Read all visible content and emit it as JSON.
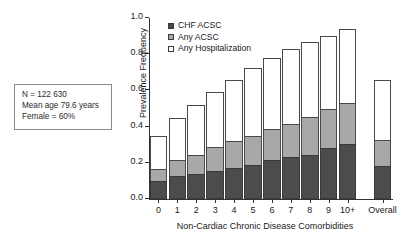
{
  "annotation": {
    "lines": [
      "N = 122 630",
      "Mean age 79.6 years",
      "Female = 60%"
    ]
  },
  "legend": {
    "position": "top-left-inside",
    "items": [
      {
        "label": "CHF ACSC",
        "color": "#4c4c4c"
      },
      {
        "label": "Any ACSC",
        "color": "#a8a8a8"
      },
      {
        "label": "Any Hospitalization",
        "color": "#ffffff"
      }
    ]
  },
  "chart_data": {
    "type": "bar",
    "subtype": "stacked-overlay",
    "title": "",
    "xlabel": "Non-Cardiac Chronic Disease Comorbidities",
    "ylabel": "Prevalence Frequency",
    "ylim": [
      0.0,
      1.0
    ],
    "ytick_labels": [
      "0.0",
      "0.2",
      "0.4",
      "0.6",
      "0.8",
      "1.0"
    ],
    "ytick_values": [
      0.0,
      0.2,
      0.4,
      0.6,
      0.8,
      1.0
    ],
    "grid": false,
    "categories": [
      "0",
      "1",
      "2",
      "3",
      "4",
      "5",
      "6",
      "7",
      "8",
      "9",
      "10+",
      "Overall"
    ],
    "series": [
      {
        "name": "Any Hospitalization",
        "color": "#ffffff",
        "values": [
          0.35,
          0.445,
          0.52,
          0.59,
          0.655,
          0.725,
          0.78,
          0.83,
          0.865,
          0.9,
          0.94,
          0.655
        ]
      },
      {
        "name": "Any ACSC",
        "color": "#a8a8a8",
        "values": [
          0.165,
          0.215,
          0.245,
          0.285,
          0.32,
          0.35,
          0.385,
          0.415,
          0.455,
          0.5,
          0.53,
          0.325
        ]
      },
      {
        "name": "CHF ACSC",
        "color": "#4c4c4c",
        "values": [
          0.1,
          0.125,
          0.14,
          0.155,
          0.17,
          0.19,
          0.215,
          0.23,
          0.245,
          0.28,
          0.305,
          0.18
        ]
      }
    ]
  }
}
